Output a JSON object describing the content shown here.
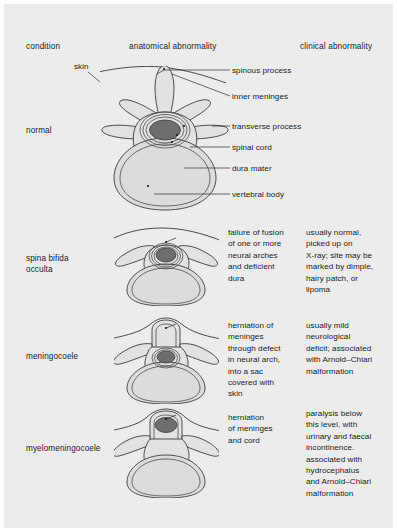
{
  "figure": {
    "background_color": "#ececed",
    "page_color": "#ffffff"
  },
  "headers": {
    "condition": "condition",
    "anatomical": "anatomical abnormality",
    "clinical": "clinical abnormality"
  },
  "callouts": {
    "skin": "skin",
    "spinous_process": "spinous process",
    "inner_meninges": "inner meninges",
    "transverse_process": "transverse process",
    "spinal_cord": "spinal cord",
    "dura_mater": "dura mater",
    "vertebral_body": "vertebral body"
  },
  "rows": [
    {
      "condition": "normal",
      "anatomical": "",
      "clinical": ""
    },
    {
      "condition": "spina bifida\nocculta",
      "anatomical": "failure of fusion\nof one or more\nneural arches\nand deficient\ndura",
      "clinical": "usually normal,\npicked up on\nX-ray; site may be\nmarked by dimple,\nhairy patch, or\nlipoma"
    },
    {
      "condition": "meningocoele",
      "anatomical": "herniation of\nmeninges\nthrough defect\nin neural arch,\ninto a sac\ncovered with\nskin",
      "clinical": "usually mild\nneurological\ndeficit; associated\nwith Arnold–Chiari\nmalformation"
    },
    {
      "condition": "myelomeningocoele",
      "anatomical": "herniation\nof meninges\nand cord",
      "clinical": "paralysis below\nthis level, with\nurinary and faecal\nincontinence.\nassociated with\nhydrocephalus\nand Arnold–Chiari\nmalformation"
    }
  ],
  "colors": {
    "bone_fill": "#e2e2e2",
    "body_fill": "#dcdcdc",
    "cord_fill": "#6e6e6e",
    "outline": "#3b3b3b",
    "text": "#1b1b1b"
  }
}
